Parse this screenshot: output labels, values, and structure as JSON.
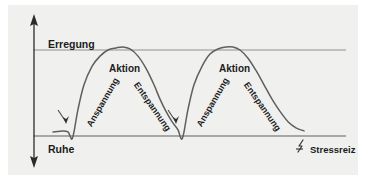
{
  "figure": {
    "kind": "stress-response-curve-diagram",
    "background_color": "#f0f0ef",
    "line_color": "#5a5a5a",
    "axis_color": "#3a3a3a",
    "text_color": "#1c1c1c"
  },
  "axis": {
    "y_top_label": "Erregung",
    "y_bottom_label": "Ruhe",
    "arrow_up_icon": "arrow-up-icon",
    "arrow_down_icon": "arrow-down-icon"
  },
  "legend": {
    "icon": "lightning-bolt-icon",
    "label": "Stressreiz"
  },
  "phases": [
    {
      "id": "anspannung-1",
      "label": "Anspannung",
      "cycle": 1,
      "rotation_deg": -60
    },
    {
      "id": "aktion-1",
      "label": "Aktion",
      "cycle": 1,
      "rotation_deg": 0
    },
    {
      "id": "entspannung-1",
      "label": "Entspannung",
      "cycle": 1,
      "rotation_deg": 55
    },
    {
      "id": "anspannung-2",
      "label": "Anspannung",
      "cycle": 2,
      "rotation_deg": -60
    },
    {
      "id": "aktion-2",
      "label": "Aktion",
      "cycle": 2,
      "rotation_deg": 0
    },
    {
      "id": "entspannung-2",
      "label": "Entspannung",
      "cycle": 2,
      "rotation_deg": 55
    }
  ],
  "chart_data": {
    "type": "line",
    "title": "",
    "xlabel": "",
    "ylabel": "Erregung",
    "grid": false,
    "legend_position": "bottom-right",
    "ylim": [
      0,
      100
    ],
    "y_reference_lines": [
      {
        "name": "Erregung",
        "value": 92
      },
      {
        "name": "Ruhe",
        "value": 8
      }
    ],
    "annotations": [
      {
        "text": "Anspannung",
        "cycle": 1
      },
      {
        "text": "Aktion",
        "cycle": 1
      },
      {
        "text": "Entspannung",
        "cycle": 1
      },
      {
        "text": "Anspannung",
        "cycle": 2
      },
      {
        "text": "Aktion",
        "cycle": 2
      },
      {
        "text": "Entspannung",
        "cycle": 2
      },
      {
        "text": "Stressreiz",
        "cycle": 0
      }
    ],
    "stimulus_markers_x": [
      62,
      172
    ],
    "series": [
      {
        "name": "Erregungsniveau",
        "x": [
          45,
          55,
          60,
          62,
          64,
          66,
          70,
          76,
          84,
          92,
          100,
          108,
          115,
          122,
          130,
          138,
          146,
          152,
          158,
          164,
          170,
          172,
          174,
          176,
          180,
          186,
          194,
          202,
          210,
          218,
          225,
          232,
          240,
          248,
          256,
          264,
          272,
          280,
          288,
          296
        ],
        "y": [
          12,
          13,
          12,
          8,
          5,
          12,
          34,
          58,
          76,
          86,
          92,
          94,
          95,
          93,
          86,
          74,
          58,
          44,
          32,
          22,
          14,
          8,
          5,
          12,
          34,
          58,
          76,
          88,
          93,
          95,
          95,
          92,
          84,
          72,
          58,
          44,
          32,
          22,
          16,
          13
        ]
      }
    ]
  }
}
